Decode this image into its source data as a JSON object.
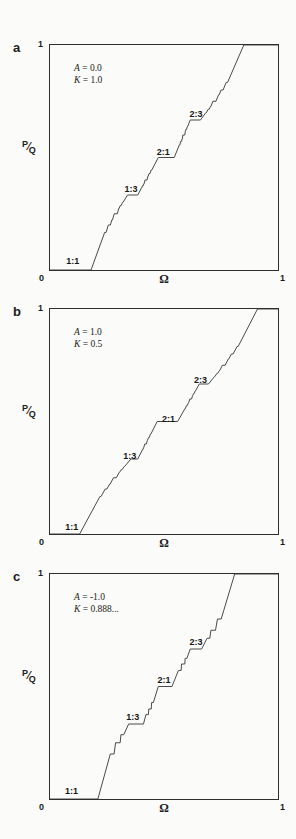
{
  "figure": {
    "background": "#fbfbf9",
    "line_color": "#4a4a4a",
    "border_color": "#2e2e2e"
  },
  "axis": {
    "xlabel": "Ω",
    "ylabel": "P/Q",
    "ylabel_numerator": "P",
    "ylabel_slash": "⁄",
    "ylabel_denominator": "Q",
    "x_min_label": "0",
    "x_max_label": "1",
    "y_max_label": "1"
  },
  "chart_data": [
    {
      "type": "line",
      "panel_letter": "a",
      "param_lines": [
        "A = 0.0",
        "K = 1.0"
      ],
      "xlabel": "Ω",
      "ylabel": "P/Q",
      "xlim": [
        0,
        1
      ],
      "ylim": [
        0,
        1
      ],
      "curve": {
        "description": "devil's staircase of winding number P/Q vs drive frequency Ω",
        "x_at_zero_plateau_end": 0.18,
        "x_at_one_plateau_start": 0.85,
        "major_steps": [
          {
            "ratio_label": "1:3",
            "pq": 0.33333,
            "omega_start": 0.34,
            "omega_end": 0.385
          },
          {
            "ratio_label": "2:1",
            "pq": 0.5,
            "omega_start": 0.475,
            "omega_end": 0.545
          },
          {
            "ratio_label": "2:3",
            "pq": 0.66667,
            "omega_start": 0.615,
            "omega_end": 0.66
          }
        ],
        "minor_step_width": 0.22,
        "minor_step_exponent": 2.0,
        "minor_depth": 3,
        "end_ease": 1.35
      },
      "step_labels": [
        {
          "text": "1:1",
          "x": 0.1,
          "y": 0.04
        },
        {
          "text": "1:3",
          "x": 0.355,
          "y": 0.36
        },
        {
          "text": "2:1",
          "x": 0.497,
          "y": 0.525
        },
        {
          "text": "2:3",
          "x": 0.64,
          "y": 0.695
        }
      ]
    },
    {
      "type": "line",
      "panel_letter": "b",
      "param_lines": [
        "A = 1.0",
        "K = 0.5"
      ],
      "xlabel": "Ω",
      "ylabel": "P/Q",
      "xlim": [
        0,
        1
      ],
      "ylim": [
        0,
        1
      ],
      "curve": {
        "description": "devil's staircase of winding number P/Q vs drive frequency Ω",
        "x_at_zero_plateau_end": 0.13,
        "x_at_one_plateau_start": 0.91,
        "major_steps": [
          {
            "ratio_label": "1:3",
            "pq": 0.33333,
            "omega_start": 0.355,
            "omega_end": 0.385
          },
          {
            "ratio_label": "2:1",
            "pq": 0.5,
            "omega_start": 0.47,
            "omega_end": 0.56
          },
          {
            "ratio_label": "2:3",
            "pq": 0.66667,
            "omega_start": 0.655,
            "omega_end": 0.695
          }
        ],
        "minor_step_width": 0.3,
        "minor_step_exponent": 2.3,
        "minor_depth": 3,
        "end_ease": 1.3
      },
      "step_labels": [
        {
          "text": "1:1",
          "x": 0.095,
          "y": 0.03
        },
        {
          "text": "1:3",
          "x": 0.35,
          "y": 0.345
        },
        {
          "text": "2:1",
          "x": 0.52,
          "y": 0.51
        },
        {
          "text": "2:3",
          "x": 0.66,
          "y": 0.685
        }
      ]
    },
    {
      "type": "line",
      "panel_letter": "c",
      "param_lines": [
        "A = -1.0",
        "K = 0.888..."
      ],
      "xlabel": "Ω",
      "ylabel": "P/Q",
      "xlim": [
        0,
        1
      ],
      "ylim": [
        0,
        1
      ],
      "curve": {
        "description": "devil's staircase of winding number P/Q vs drive frequency Ω",
        "x_at_zero_plateau_end": 0.21,
        "x_at_one_plateau_start": 0.81,
        "major_steps": [
          {
            "ratio_label": "1:3",
            "pq": 0.33333,
            "omega_start": 0.345,
            "omega_end": 0.41
          },
          {
            "ratio_label": "2:1",
            "pq": 0.5,
            "omega_start": 0.475,
            "omega_end": 0.535
          },
          {
            "ratio_label": "2:3",
            "pq": 0.66667,
            "omega_start": 0.615,
            "omega_end": 0.665
          }
        ],
        "minor_step_width": 0.07,
        "minor_step_exponent": 0.9,
        "minor_depth": 2,
        "end_ease": 1.5
      },
      "step_labels": [
        {
          "text": "1:1",
          "x": 0.094,
          "y": 0.035
        },
        {
          "text": "1:3",
          "x": 0.363,
          "y": 0.365
        },
        {
          "text": "2:1",
          "x": 0.5,
          "y": 0.53
        },
        {
          "text": "2:3",
          "x": 0.64,
          "y": 0.7
        }
      ]
    }
  ]
}
